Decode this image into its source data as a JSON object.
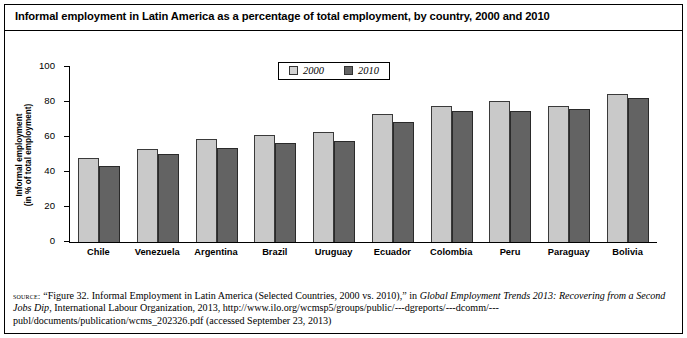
{
  "figure": {
    "title": "Informal employment in Latin America as a percentage of total employment, by country, 2000 and 2010"
  },
  "legend": {
    "position": "top-center",
    "items": [
      {
        "label": "2000",
        "color": "#d2d2d2"
      },
      {
        "label": "2010",
        "color": "#646464"
      }
    ]
  },
  "axes": {
    "ylabel_line1": "Informal employment",
    "ylabel_line2": "(in % of total employment)",
    "yticks": [
      "0",
      "20",
      "40",
      "60",
      "80",
      "100"
    ]
  },
  "source": {
    "label": "source:",
    "text_1": "“Figure 32. Informal Employment in Latin America (Selected Countries, 2000 vs. 2010),” in ",
    "italic_1": "Global Employment Trends 2013: Recovering from a Second Jobs Dip",
    "text_2": ", International Labour Organization, 2013, http://www.ilo.org/wcmsp5/groups/public/---dgreports/---dcomm/---publ/documents/publication/wcms_202326.pdf (accessed September 23, 2013)"
  },
  "chart_data": {
    "type": "bar",
    "title": "Informal employment in Latin America as a percentage of total employment, by country, 2000 and 2010",
    "xlabel": "",
    "ylabel": "Informal employment (in % of total employment)",
    "ylim": [
      0,
      100
    ],
    "yticks": [
      0,
      20,
      40,
      60,
      80,
      100
    ],
    "grid": false,
    "legend_position": "top-center",
    "categories": [
      "Chile",
      "Venezuela",
      "Argentina",
      "Brazil",
      "Uruguay",
      "Ecuador",
      "Colombia",
      "Peru",
      "Paraguay",
      "Bolivia"
    ],
    "series": [
      {
        "name": "2000",
        "color": "#c9c9c9",
        "values": [
          48,
          53,
          59,
          61,
          63,
          73,
          78,
          80.5,
          78,
          84.5
        ]
      },
      {
        "name": "2010",
        "color": "#636363",
        "values": [
          43.5,
          50.5,
          53.5,
          56.5,
          58,
          68.5,
          75,
          75,
          76,
          82.5
        ]
      }
    ]
  }
}
